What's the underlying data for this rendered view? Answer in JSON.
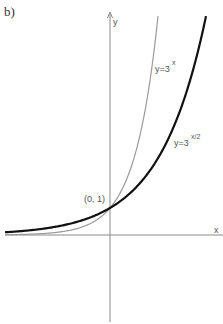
{
  "panel_label": "b)",
  "axes": {
    "x_label": "x",
    "y_label": "y"
  },
  "point_label": "(0, 1)",
  "curves": [
    {
      "name": "y=3^x",
      "label_base": "y=3",
      "label_exp": "x",
      "color": "#9a9a9a",
      "width": 1.2,
      "base": 3,
      "k": 1
    },
    {
      "name": "y=3^(x/2)",
      "label_base": "y=3",
      "label_exp": "x/2",
      "color": "#111111",
      "width": 2.2,
      "base": 3,
      "k": 0.5
    }
  ],
  "colors": {
    "axis": "#8a8a8a",
    "text": "#555555"
  },
  "chart_data": {
    "type": "line",
    "title": "",
    "xlabel": "x",
    "ylabel": "y",
    "xlim": [
      -4.2,
      4.5
    ],
    "ylim": [
      -3.4,
      8.3
    ],
    "grid": false,
    "legend": "inline labels",
    "annotations": [
      "(0, 1)",
      "y=3^x",
      "y=3^(x/2)",
      "b)"
    ],
    "series": [
      {
        "name": "y=3^x",
        "x": [
          -4,
          -3,
          -2,
          -1,
          0,
          1,
          1.5,
          1.9
        ],
        "values": [
          0.012,
          0.037,
          0.111,
          0.333,
          1,
          3,
          5.196,
          8.06
        ]
      },
      {
        "name": "y=3^(x/2)",
        "x": [
          -4,
          -3,
          -2,
          -1,
          0,
          1,
          2,
          3,
          3.8
        ],
        "values": [
          0.111,
          0.192,
          0.333,
          0.577,
          1,
          1.732,
          3,
          5.196,
          8.06
        ]
      }
    ]
  }
}
